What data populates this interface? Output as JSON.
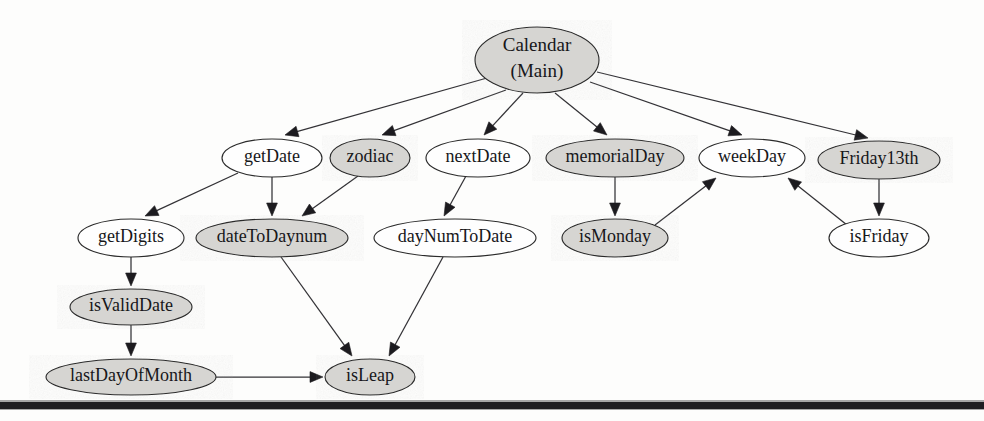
{
  "figure": {
    "width": 984,
    "height": 421,
    "background_color": "#fdfdfc",
    "node_fill_gray": "#d6d5d2",
    "node_fill_white": "#fefefe",
    "node_stroke_color": "#2b2b2b",
    "edge_color": "#333236",
    "label_color": "#17171a"
  },
  "nodes": [
    {
      "id": "calendar_main",
      "lines": [
        "Calendar",
        "(Main)"
      ],
      "shaded": true,
      "cx": 537,
      "cy": 60,
      "rx": 62,
      "ry": 33,
      "font_size": 19
    },
    {
      "id": "getDate",
      "lines": [
        "getDate"
      ],
      "shaded": false,
      "cx": 272,
      "cy": 158,
      "rx": 50,
      "ry": 19,
      "font_size": 18
    },
    {
      "id": "zodiac",
      "lines": [
        "zodiac"
      ],
      "shaded": true,
      "cx": 370,
      "cy": 158,
      "rx": 40,
      "ry": 19,
      "font_size": 18
    },
    {
      "id": "nextDate",
      "lines": [
        "nextDate"
      ],
      "shaded": false,
      "cx": 478,
      "cy": 158,
      "rx": 52,
      "ry": 19,
      "font_size": 18
    },
    {
      "id": "memorialDay",
      "lines": [
        "memorialDay"
      ],
      "shaded": true,
      "cx": 615,
      "cy": 158,
      "rx": 69,
      "ry": 19,
      "font_size": 18
    },
    {
      "id": "weekDay",
      "lines": [
        "weekDay"
      ],
      "shaded": false,
      "cx": 752,
      "cy": 158,
      "rx": 53,
      "ry": 19,
      "font_size": 18
    },
    {
      "id": "Friday13th",
      "lines": [
        "Friday13th"
      ],
      "shaded": true,
      "cx": 879,
      "cy": 160,
      "rx": 61,
      "ry": 19,
      "font_size": 18
    },
    {
      "id": "getDigits",
      "lines": [
        "getDigits"
      ],
      "shaded": false,
      "cx": 131,
      "cy": 238,
      "rx": 53,
      "ry": 19,
      "font_size": 18
    },
    {
      "id": "dateToDaynum",
      "lines": [
        "dateToDaynum"
      ],
      "shaded": true,
      "cx": 272,
      "cy": 238,
      "rx": 76,
      "ry": 19,
      "font_size": 18
    },
    {
      "id": "dayNumToDate",
      "lines": [
        "dayNumToDate"
      ],
      "shaded": false,
      "cx": 455,
      "cy": 238,
      "rx": 81,
      "ry": 19,
      "font_size": 18
    },
    {
      "id": "isMonday",
      "lines": [
        "isMonday"
      ],
      "shaded": true,
      "cx": 615,
      "cy": 238,
      "rx": 53,
      "ry": 19,
      "font_size": 18
    },
    {
      "id": "isFriday",
      "lines": [
        "isFriday"
      ],
      "shaded": false,
      "cx": 879,
      "cy": 238,
      "rx": 50,
      "ry": 19,
      "font_size": 18
    },
    {
      "id": "isValidDate",
      "lines": [
        "isValidDate"
      ],
      "shaded": true,
      "cx": 131,
      "cy": 307,
      "rx": 61,
      "ry": 18,
      "font_size": 18
    },
    {
      "id": "lastDayOfMonth",
      "lines": [
        "lastDayOfMonth"
      ],
      "shaded": true,
      "cx": 131,
      "cy": 377,
      "rx": 85,
      "ry": 18,
      "font_size": 18
    },
    {
      "id": "isLeap",
      "lines": [
        "isLeap"
      ],
      "shaded": true,
      "cx": 370,
      "cy": 377,
      "rx": 45,
      "ry": 18,
      "font_size": 18
    }
  ],
  "edges": [
    {
      "from": "calendar_main",
      "to": "getDate",
      "x1": 487,
      "y1": 78,
      "x2": 285,
      "y2": 135
    },
    {
      "from": "calendar_main",
      "to": "zodiac",
      "x1": 506,
      "y1": 90,
      "x2": 382,
      "y2": 135
    },
    {
      "from": "calendar_main",
      "to": "nextDate",
      "x1": 523,
      "y1": 93,
      "x2": 484,
      "y2": 135
    },
    {
      "from": "calendar_main",
      "to": "memorialDay",
      "x1": 555,
      "y1": 93,
      "x2": 607,
      "y2": 135
    },
    {
      "from": "calendar_main",
      "to": "weekDay",
      "x1": 590,
      "y1": 82,
      "x2": 742,
      "y2": 135
    },
    {
      "from": "calendar_main",
      "to": "Friday13th",
      "x1": 597,
      "y1": 72,
      "x2": 868,
      "y2": 138
    },
    {
      "from": "getDate",
      "to": "getDigits",
      "x1": 238,
      "y1": 173,
      "x2": 145,
      "y2": 216
    },
    {
      "from": "getDate",
      "to": "dateToDaynum",
      "x1": 272,
      "y1": 177,
      "x2": 272,
      "y2": 216
    },
    {
      "from": "zodiac",
      "to": "dateToDaynum",
      "x1": 358,
      "y1": 176,
      "x2": 302,
      "y2": 216
    },
    {
      "from": "nextDate",
      "to": "dayNumToDate",
      "x1": 466,
      "y1": 176,
      "x2": 444,
      "y2": 216
    },
    {
      "from": "memorialDay",
      "to": "isMonday",
      "x1": 615,
      "y1": 177,
      "x2": 615,
      "y2": 216
    },
    {
      "from": "isMonday",
      "to": "weekDay",
      "x1": 655,
      "y1": 225,
      "x2": 716,
      "y2": 178
    },
    {
      "from": "isFriday",
      "to": "weekDay",
      "x1": 847,
      "y1": 225,
      "x2": 788,
      "y2": 178
    },
    {
      "from": "Friday13th",
      "to": "isFriday",
      "x1": 879,
      "y1": 179,
      "x2": 879,
      "y2": 216
    },
    {
      "from": "getDigits",
      "to": "isValidDate",
      "x1": 131,
      "y1": 257,
      "x2": 131,
      "y2": 286
    },
    {
      "from": "isValidDate",
      "to": "lastDayOfMonth",
      "x1": 131,
      "y1": 325,
      "x2": 131,
      "y2": 356
    },
    {
      "from": "lastDayOfMonth",
      "to": "isLeap",
      "x1": 216,
      "y1": 377,
      "x2": 323,
      "y2": 377
    },
    {
      "from": "dateToDaynum",
      "to": "isLeap",
      "x1": 281,
      "y1": 257,
      "x2": 352,
      "y2": 356
    },
    {
      "from": "dayNumToDate",
      "to": "isLeap",
      "x1": 443,
      "y1": 257,
      "x2": 389,
      "y2": 356
    }
  ],
  "footer_rule": {
    "label": "page-bottom-rule",
    "y": 402,
    "height": 7
  }
}
